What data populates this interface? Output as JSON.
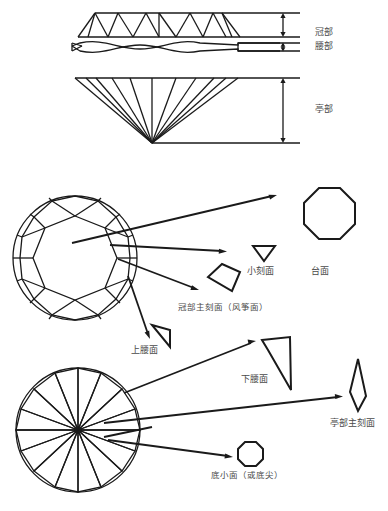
{
  "figure": {
    "title_semantic": "round-brilliant-diamond-facet-diagram",
    "stroke_color": "#1a1a1a",
    "label_color": "#4a4a4a",
    "background_color": "#ffffff"
  },
  "profile_section": {
    "name": "diamond-profile-cutaway",
    "labels": [
      {
        "id": "crown",
        "text": "冠部"
      },
      {
        "id": "girdle",
        "text": "腰部"
      },
      {
        "id": "pavilion",
        "text": "亭部"
      }
    ]
  },
  "crown_view_section": {
    "name": "crown-face-up-view",
    "labels": [
      {
        "id": "table-facet",
        "text": "台面"
      },
      {
        "id": "star-facet",
        "text": "小刻面"
      },
      {
        "id": "crown-main-facet",
        "text": "冠部主刻面（风筝面）"
      },
      {
        "id": "upper-girdle-facet",
        "text": "上腰面"
      }
    ]
  },
  "pavilion_view_section": {
    "name": "pavilion-view",
    "labels": [
      {
        "id": "lower-girdle-facet",
        "text": "下腰面"
      },
      {
        "id": "pavilion-main-facet",
        "text": "亭部主刻面"
      },
      {
        "id": "culet",
        "text": "底小面（或底尖）"
      }
    ]
  },
  "shape_keys": {
    "table_octagon": "octagon-shape",
    "star_triangle": "inverted-triangle-shape",
    "kite": "kite-shape",
    "upper_girdle_triangle": "narrow-triangle-shape",
    "lower_girdle_wedge": "curved-wedge-shape",
    "pavilion_main_lozenge": "elongated-lozenge-shape",
    "culet_octagon": "small-octagon-shape"
  }
}
